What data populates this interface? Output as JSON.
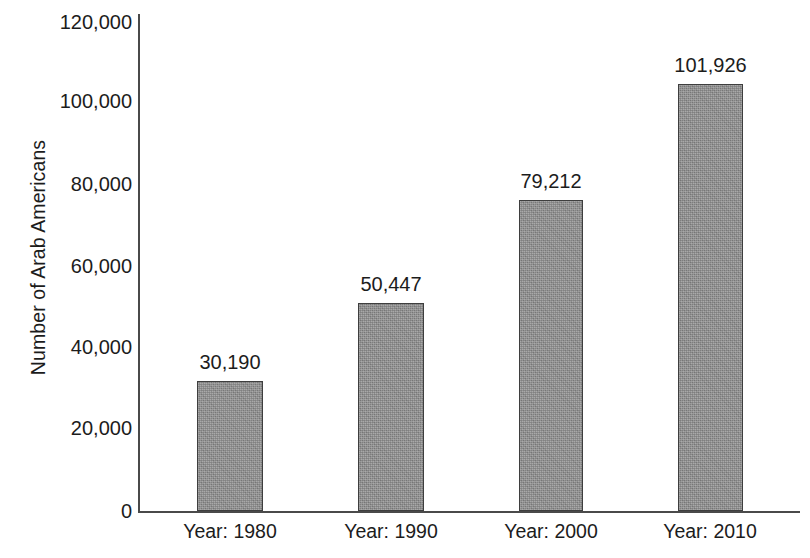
{
  "chart_data": {
    "type": "bar",
    "title": "",
    "subtitle": "",
    "xlabel": "",
    "ylabel": "Number of Arab Americans",
    "categories": [
      "Year: 1980",
      "Year: 1990",
      "Year: 2000",
      "Year: 2010"
    ],
    "values": [
      30190,
      50447,
      79212,
      101926
    ],
    "value_labels": [
      "30,190",
      "50,447",
      "79,212",
      "101,926"
    ],
    "ylim": [
      0,
      120000
    ],
    "y_ticks": [
      0,
      20000,
      40000,
      60000,
      80000,
      100000,
      120000
    ],
    "y_tick_labels": [
      "0",
      "20,000",
      "40,000",
      "60,000",
      "80,000",
      "100,000",
      "120,000"
    ],
    "grid": false,
    "legend": null,
    "legend_position": "none",
    "bar_fill_color": "#8d8d8d",
    "bar_border_color": "#3e3e3e",
    "axis_color": "#4a4a4a",
    "text_color": "#1c1c1c",
    "background_color": "#ffffff"
  },
  "geometry": {
    "axis": {
      "y_line_x": 138,
      "y_line_top": 14,
      "baseline_y": 511,
      "x_line_right": 800
    },
    "bars": [
      {
        "left": 197,
        "width": 66,
        "top": 381
      },
      {
        "left": 358,
        "width": 66,
        "top": 303
      },
      {
        "left": 519,
        "width": 64,
        "top": 200
      },
      {
        "left": 678,
        "width": 65,
        "top": 84
      }
    ],
    "y_tick_y": [
      511,
      428,
      347,
      266,
      184,
      101,
      22
    ],
    "x_tick_center": [
      230,
      391,
      551,
      710
    ]
  }
}
